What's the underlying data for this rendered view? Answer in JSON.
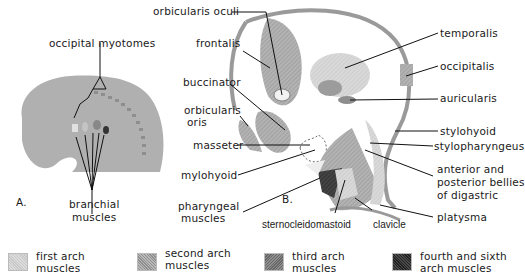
{
  "figure": {
    "panel_a": {
      "tag": "A.",
      "labels": {
        "occipital_myotomes": "occipital myotomes",
        "branchial_muscles_line1": "branchial",
        "branchial_muscles_line2": "muscles"
      }
    },
    "panel_b": {
      "tag": "B.",
      "labels": {
        "orbicularis_oculi": "orbicularis oculi",
        "frontalis": "frontalis",
        "buccinator": "buccinator",
        "orbicularis_oris_line1": "orbicularis",
        "orbicularis_oris_line2": "oris",
        "masseter": "masseter",
        "mylohyoid": "mylohyoid",
        "pharyngeal_line1": "pharyngeal",
        "pharyngeal_line2": "muscles",
        "sternocleidomastoid": "sternocleidomastoid",
        "clavicle": "clavicle",
        "temporalis": "temporalis",
        "occipitalis": "occipitalis",
        "auricularis": "auricularis",
        "stylohyoid": "stylohyoid",
        "stylopharyngeus": "stylopharyngeus",
        "digastric_line1": "anterior and",
        "digastric_line2": "posterior bellies",
        "digastric_line3": "of digastric",
        "platysma": "platysma"
      }
    },
    "legend": [
      {
        "line1": "first arch",
        "line2": "muscles",
        "color": "#d4d4d4"
      },
      {
        "line1": "second arch",
        "line2": "muscles",
        "color": "#a9a9a9"
      },
      {
        "line1": "third arch",
        "line2": "muscles",
        "color": "#7e7e7e"
      },
      {
        "line1": "fourth and sixth",
        "line2": "arch muscles",
        "color": "#3a3a3a"
      }
    ]
  }
}
